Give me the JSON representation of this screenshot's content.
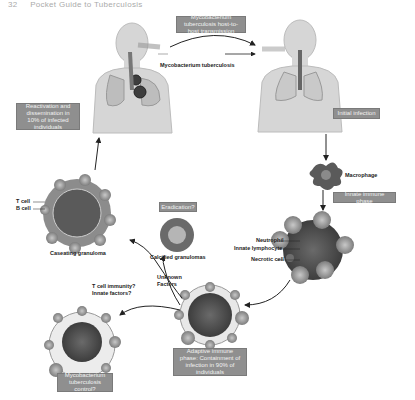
{
  "header": {
    "page_number": "32",
    "running_title": "Pocket Guide to Tuberculosis"
  },
  "boxes": {
    "transmission": "Mycobacterium tuberculosis host-to-host transmission",
    "reactivation": "Reactivation and dissemination in 10% of infected individuals",
    "initial_infection": "Initial infection",
    "innate_phase": "Innate immune phase",
    "eradication": "Eradication?",
    "adaptive_phase": "Adaptive immune phase: Containment of infection in 90% of individuals",
    "control": "Mycobacterium tuberculosis control?"
  },
  "labels": {
    "mtb": "Mycobacterium tuberculosis",
    "macrophage": "Macrophage",
    "neutrophil": "Neutrophil",
    "innate_lymphocyte": "Innate lymphocyte",
    "necrotic_cell": "Necrotic cell",
    "t_cell": "T cell",
    "b_cell": "B cell",
    "caseating": "Caseating granuloma",
    "calcified": "Calcified granulomas",
    "unknown_factors": "Unknown Factors",
    "t_cell_immunity": "T cell immunity? Innate factors?"
  },
  "colors": {
    "box_fill": "#8f8f8f",
    "body_fill": "#d6d6d6",
    "lung_fill": "#bdbdbd",
    "cell_fill": "#8a8a8a",
    "arrow": "#222222"
  }
}
